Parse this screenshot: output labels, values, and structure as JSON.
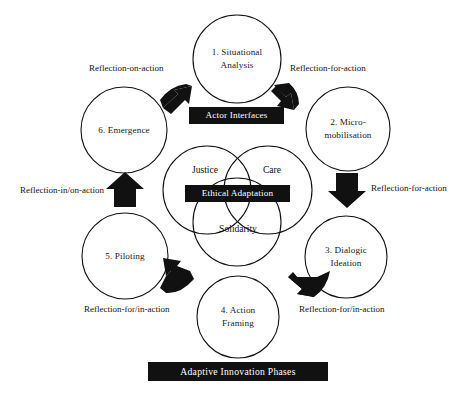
{
  "diagram": {
    "title": "Adaptive Innovation Phases",
    "phases": [
      {
        "id": "phase-1",
        "label": "1. Situational\nAnalysis",
        "cx": 237,
        "cy": 59,
        "r": 44
      },
      {
        "id": "phase-2",
        "label": "2. Micro-\nmobilisation",
        "cx": 348,
        "cy": 129,
        "r": 42
      },
      {
        "id": "phase-3",
        "label": "3. Dialogic\nIdeation",
        "cx": 346,
        "cy": 257,
        "r": 41
      },
      {
        "id": "phase-4",
        "label": "4. Action\nFraming",
        "cx": 238,
        "cy": 317,
        "r": 41
      },
      {
        "id": "phase-5",
        "label": "5. Piloting",
        "cx": 125,
        "cy": 256,
        "r": 43
      },
      {
        "id": "phase-6",
        "label": "6. Emergence",
        "cx": 124,
        "cy": 130,
        "r": 43
      }
    ],
    "venn": {
      "circles": [
        {
          "id": "venn-justice",
          "label": "Justice",
          "cx": 207,
          "cy": 190,
          "r": 44
        },
        {
          "id": "venn-care",
          "label": "Care",
          "cx": 268,
          "cy": 190,
          "r": 44
        },
        {
          "id": "venn-solidarity",
          "label": "Solidarity",
          "cx": 237,
          "cy": 222,
          "r": 44
        }
      ],
      "center_label": "Ethical Adaptation"
    },
    "boxes": [
      {
        "id": "actor-interfaces-box",
        "label": "Actor Interfaces"
      },
      {
        "id": "ethical-adaptation-box",
        "label": "Ethical Adaptation"
      },
      {
        "id": "adaptive-innovation-phases-box",
        "label": "Adaptive Innovation Phases"
      }
    ],
    "edge_labels": [
      {
        "id": "edge-label-reflection-on-action",
        "label": "Reflection-on-action"
      },
      {
        "id": "edge-label-reflection-for-action-top",
        "label": "Reflection-for-action"
      },
      {
        "id": "edge-label-reflection-for-action-right",
        "label": "Reflection-for-action"
      },
      {
        "id": "edge-label-reflection-for-in-action-right",
        "label": "Reflection-for/in-action"
      },
      {
        "id": "edge-label-reflection-for-in-action-left",
        "label": "Reflection-for/in-action"
      },
      {
        "id": "edge-label-reflection-in-on-action",
        "label": "Reflection-in/on-action"
      }
    ],
    "colors": {
      "stroke": "#111111",
      "box_fill": "#111111",
      "box_text": "#ffffff",
      "background": "#ffffff",
      "arrow_fill": "#111111"
    }
  }
}
